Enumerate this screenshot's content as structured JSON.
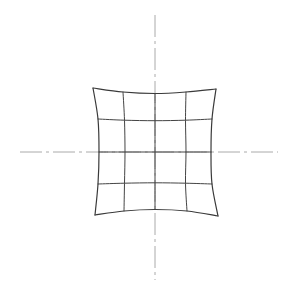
{
  "canvas": {
    "width": 297,
    "height": 297,
    "background": "#ffffff",
    "title": "Grid Distortion Diagram"
  },
  "style": {
    "grid_color": "#444444",
    "grid_width": 1.0,
    "boundary_color": "#3a3a3a",
    "boundary_width": 1.2,
    "axis_color": "#aaaaaa",
    "axis_width": 1.0,
    "axis_dash": "22 4 3 4"
  },
  "axes": {
    "center_x": 155,
    "center_y": 152,
    "horizontal": {
      "name": "horizontal-centerline",
      "x1": 20,
      "y1": 152,
      "x2": 278,
      "y2": 152
    },
    "vertical": {
      "name": "vertical-centerline",
      "x1": 155,
      "y1": 15,
      "x2": 155,
      "y2": 280
    }
  },
  "chart_data": {
    "type": "line",
    "xlabel": "",
    "ylabel": "",
    "grid": true,
    "legend": "none",
    "divisions": 4,
    "line_count_per_axis": 5,
    "nominal_spacing_px": 31,
    "undistorted_square": {
      "left": 93,
      "top": 89,
      "right": 217,
      "bottom": 215
    },
    "corners": [
      {
        "name": "top-left",
        "x": 93,
        "y": 88
      },
      {
        "name": "top-right",
        "x": 216,
        "y": 89
      },
      {
        "name": "bottom-right",
        "x": 218,
        "y": 216
      },
      {
        "name": "bottom-left",
        "x": 95,
        "y": 215
      }
    ],
    "distortion": {
      "model": "inward-bow",
      "edge_sag_px": 6,
      "interior_sag_px": 2.2,
      "center_sag_px": 0
    },
    "node_grid": [
      [
        {
          "x": 93,
          "y": 88
        },
        {
          "x": 123,
          "y": 92
        },
        {
          "x": 155,
          "y": 93.5
        },
        {
          "x": 186,
          "y": 92
        },
        {
          "x": 216,
          "y": 89
        }
      ],
      [
        {
          "x": 98,
          "y": 119
        },
        {
          "x": 124.5,
          "y": 120.2
        },
        {
          "x": 155,
          "y": 120.7
        },
        {
          "x": 185.5,
          "y": 120.2
        },
        {
          "x": 212,
          "y": 119
        }
      ],
      [
        {
          "x": 99,
          "y": 152
        },
        {
          "x": 125,
          "y": 152
        },
        {
          "x": 155,
          "y": 152
        },
        {
          "x": 186,
          "y": 152
        },
        {
          "x": 211,
          "y": 152
        }
      ],
      [
        {
          "x": 98,
          "y": 184
        },
        {
          "x": 124.5,
          "y": 183.2
        },
        {
          "x": 155,
          "y": 182.8
        },
        {
          "x": 185.5,
          "y": 183.2
        },
        {
          "x": 212,
          "y": 184
        }
      ],
      [
        {
          "x": 95,
          "y": 215
        },
        {
          "x": 124,
          "y": 211
        },
        {
          "x": 155,
          "y": 209.5
        },
        {
          "x": 187,
          "y": 211
        },
        {
          "x": 218,
          "y": 216
        }
      ]
    ],
    "horizontal_lines": [
      {
        "index": 0,
        "name": "grid-row-top-boundary",
        "sag_px": 5.5,
        "is_boundary": true
      },
      {
        "index": 1,
        "name": "grid-row-1",
        "sag_px": 1.7,
        "is_boundary": false
      },
      {
        "index": 2,
        "name": "grid-row-center",
        "sag_px": 0.0,
        "is_boundary": false
      },
      {
        "index": 3,
        "name": "grid-row-3",
        "sag_px": -1.7,
        "is_boundary": false
      },
      {
        "index": 4,
        "name": "grid-row-bottom-boundary",
        "sag_px": -5.5,
        "is_boundary": true
      }
    ],
    "vertical_lines": [
      {
        "index": 0,
        "name": "grid-col-left-boundary",
        "sag_px": 6.0,
        "is_boundary": true
      },
      {
        "index": 1,
        "name": "grid-col-1",
        "sag_px": 1.6,
        "is_boundary": false
      },
      {
        "index": 2,
        "name": "grid-col-center",
        "sag_px": 0.0,
        "is_boundary": false
      },
      {
        "index": 3,
        "name": "grid-col-3",
        "sag_px": -1.6,
        "is_boundary": false
      },
      {
        "index": 4,
        "name": "grid-col-right-boundary",
        "sag_px": -6.0,
        "is_boundary": true
      }
    ]
  }
}
